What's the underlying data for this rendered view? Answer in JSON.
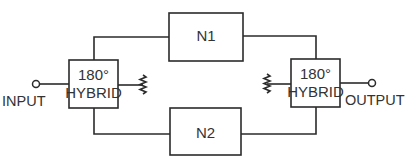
{
  "diagram": {
    "type": "block-diagram",
    "blocks": {
      "left_hybrid": {
        "line1": "180°",
        "line2": "HYBRID"
      },
      "right_hybrid": {
        "line1": "180°",
        "line2": "HYBRID"
      },
      "n1": {
        "label": "N1"
      },
      "n2": {
        "label": "N2"
      }
    },
    "ports": {
      "input": "INPUT",
      "output": "OUTPUT"
    },
    "terminations": [
      "resistor-termination-left",
      "resistor-termination-right"
    ],
    "colors": {
      "line": "#2b2b2b",
      "text": "#333333",
      "background": "#ffffff"
    }
  }
}
